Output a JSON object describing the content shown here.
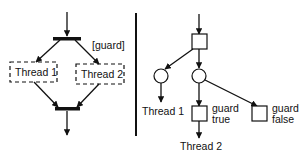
{
  "left_diagram": {
    "guard_label": "[guard]",
    "thread1_label": "Thread 1",
    "thread2_label": "Thread 2"
  },
  "right_diagram": {
    "thread1_label": "Thread 1",
    "thread2_label": "Thread 2",
    "guard_true_line1": "guard",
    "guard_true_line2": "true",
    "guard_false_line1": "guard",
    "guard_false_line2": "false"
  },
  "colors": {
    "stroke": "#111111",
    "background": "#ffffff"
  }
}
